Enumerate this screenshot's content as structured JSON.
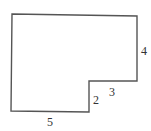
{
  "diagram": {
    "type": "rectilinear-polygon",
    "vertices": [
      [
        12,
        14
      ],
      [
        137,
        16
      ],
      [
        137,
        81
      ],
      [
        89,
        81
      ],
      [
        89,
        112
      ],
      [
        11,
        111
      ]
    ],
    "stroke_color": "#555555",
    "labels": [
      {
        "id": "right-side",
        "text": "4",
        "x": 141,
        "y": 55
      },
      {
        "id": "notch-top",
        "text": "3",
        "x": 109,
        "y": 96
      },
      {
        "id": "notch-side",
        "text": "2",
        "x": 93,
        "y": 104
      },
      {
        "id": "bottom-side",
        "text": "5",
        "x": 47,
        "y": 126
      }
    ]
  }
}
